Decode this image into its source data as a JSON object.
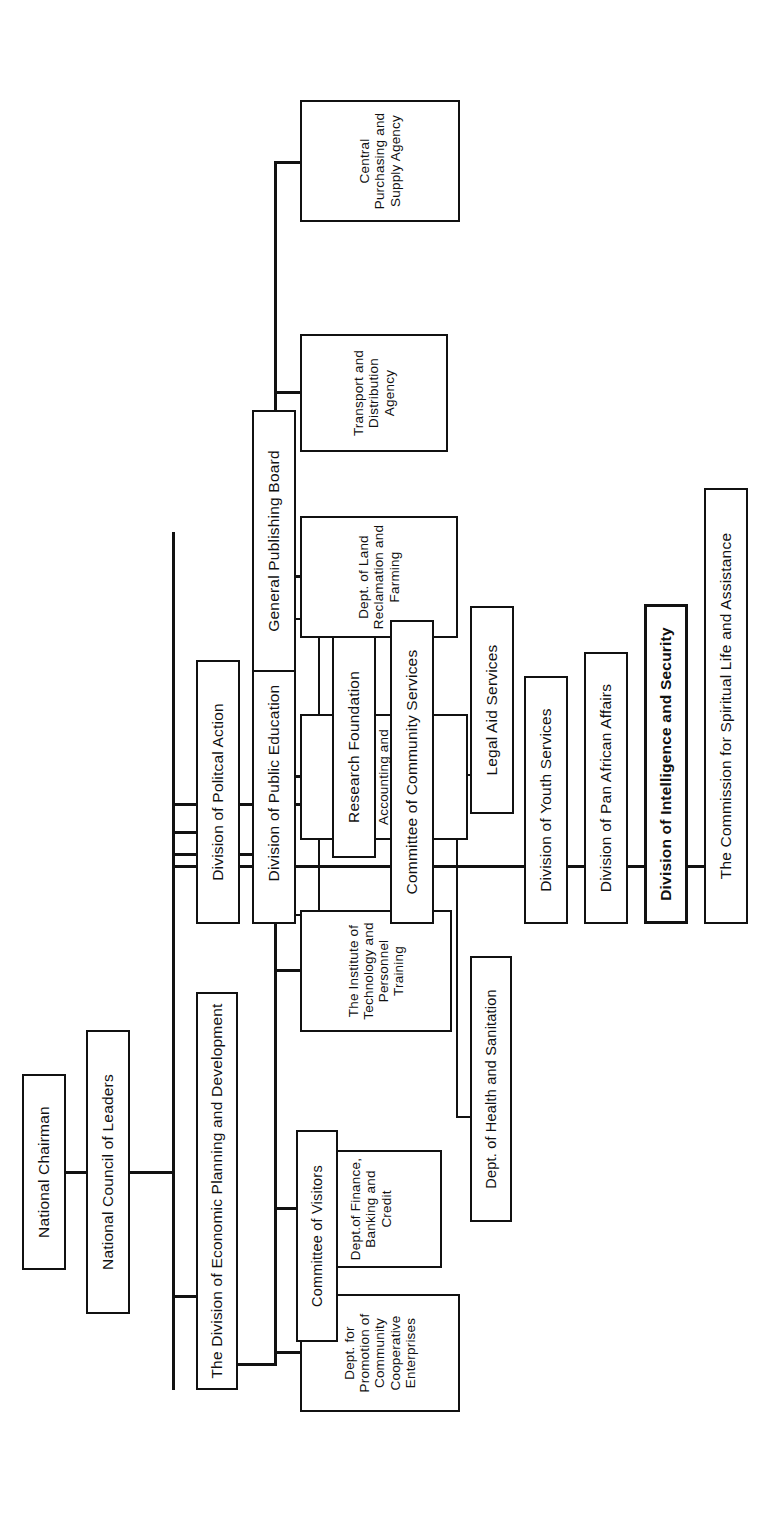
{
  "chart": {
    "type": "org-chart",
    "orientation": "rotated-90-ccw",
    "style": {
      "line_color": "#111111",
      "box_border_color": "#111111",
      "box_fill": "#ffffff",
      "page_background": "#ffffff"
    }
  },
  "nodes": {
    "national_chairman": "National Chairman",
    "national_council": "National Council of Leaders",
    "economic_division": "The Division of Economic Planning and Development",
    "dept_promotion": "Dept. for Promotion of Community Cooperative Enterprises",
    "dept_finance": "Dept.of Finance, Banking and Credit",
    "institute_technology": "The Institute of Technology and Personnel Training",
    "central_office_accounting": "Central Office of Accounting and Financial Control",
    "dept_land": "Dept. of Land Reclamation and Farming",
    "transport_agency": "Transport and Distribution Agency",
    "central_purchasing": "Central Purchasing and Supply Agency",
    "division_political": "Division of Politcal Action",
    "division_public_education": "Division of Public Education",
    "committee_visitors": "Committee of Visitors",
    "research_foundation": "Research Foundation",
    "general_publishing": "General Publishing Board",
    "committee_community": "Committee of Community Services",
    "dept_health": "Dept. of Health and Sanitation",
    "legal_aid": "Legal Aid Services",
    "division_youth": "Division of Youth Services",
    "division_pan_african": "Division of Pan African Affairs",
    "division_intelligence": "Division of Intelligence and Security",
    "commission_spiritual": "The Commission for Spiritual Life and Assistance"
  },
  "hierarchy": {
    "root": "national_chairman",
    "edges": [
      {
        "from": "national_chairman",
        "to": "national_council"
      },
      {
        "from": "national_council",
        "to": "economic_division"
      },
      {
        "from": "national_council",
        "to": "division_political"
      },
      {
        "from": "national_council",
        "to": "division_public_education"
      },
      {
        "from": "national_council",
        "to": "committee_community"
      },
      {
        "from": "national_council",
        "to": "division_youth"
      },
      {
        "from": "national_council",
        "to": "division_pan_african"
      },
      {
        "from": "national_council",
        "to": "division_intelligence"
      },
      {
        "from": "economic_division",
        "to": "dept_promotion"
      },
      {
        "from": "economic_division",
        "to": "dept_finance"
      },
      {
        "from": "economic_division",
        "to": "institute_technology"
      },
      {
        "from": "economic_division",
        "to": "central_office_accounting"
      },
      {
        "from": "economic_division",
        "to": "dept_land"
      },
      {
        "from": "economic_division",
        "to": "transport_agency"
      },
      {
        "from": "economic_division",
        "to": "central_purchasing"
      },
      {
        "from": "division_public_education",
        "to": "committee_visitors"
      },
      {
        "from": "division_public_education",
        "to": "research_foundation"
      },
      {
        "from": "research_foundation",
        "to": "general_publishing"
      },
      {
        "from": "committee_community",
        "to": "dept_health"
      },
      {
        "from": "committee_community",
        "to": "legal_aid"
      },
      {
        "from": "division_intelligence",
        "to": "commission_spiritual"
      }
    ]
  }
}
